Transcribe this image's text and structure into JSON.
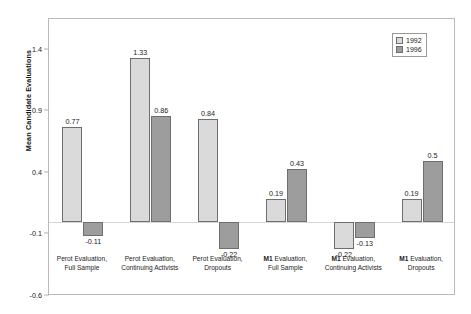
{
  "chart_data": {
    "type": "bar",
    "title": "",
    "xlabel": "",
    "ylabel": "Mean Candidate Evaluations",
    "ylim": [
      -0.6,
      1.65
    ],
    "yticks": [
      "1.4",
      "0.9",
      "0.4",
      "-0.1",
      "-0.6"
    ],
    "ytick_values": [
      1.4,
      0.9,
      0.4,
      -0.1,
      -0.6
    ],
    "grid": false,
    "legend_position": "top-right",
    "categories": [
      "Perot Evaluation, Full Sample",
      "Perot Evaluation, Continuing Activists",
      "Perot Evaluation, Dropouts",
      "M1 Evaluation, Full Sample",
      "M1 Evaluation, Continuing Activists",
      "M1 Evaluation, Dropouts"
    ],
    "category_lines": [
      {
        "line1": "Perot Evaluation,",
        "line2": "Full Sample",
        "bold_prefix": ""
      },
      {
        "line1": "Perot Evaluation,",
        "line2": "Continuing Activists",
        "bold_prefix": ""
      },
      {
        "line1": "Perot Evaluation,",
        "line2": "Dropouts",
        "bold_prefix": ""
      },
      {
        "line1": "Evaluation,",
        "line2": "Full Sample",
        "bold_prefix": "M1"
      },
      {
        "line1": "Evaluation,",
        "line2": "Continuing Activists",
        "bold_prefix": "M1"
      },
      {
        "line1": "Evaluation,",
        "line2": "Dropouts",
        "bold_prefix": "M1"
      }
    ],
    "series": [
      {
        "name": "1992",
        "color": "#dadada",
        "values": [
          0.77,
          1.33,
          0.84,
          0.19,
          -0.22,
          0.19
        ],
        "labels": [
          "0.77",
          "1.33",
          "0.84",
          "0.19",
          "-0.22",
          "0.19"
        ]
      },
      {
        "name": "1996",
        "color": "#9d9d9d",
        "values": [
          -0.11,
          0.86,
          -0.22,
          0.43,
          -0.13,
          0.5
        ],
        "labels": [
          "-0.11",
          "0.86",
          "-0.22",
          "0.43",
          "-0.13",
          "0.5"
        ]
      }
    ]
  },
  "legend": {
    "entries": [
      {
        "label": "1992"
      },
      {
        "label": "1996"
      }
    ]
  }
}
